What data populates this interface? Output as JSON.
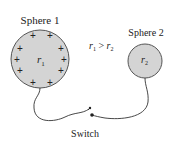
{
  "diagram": {
    "sphere1": {
      "label": "Sphere 1",
      "radius_label": "r",
      "radius_sub": "1",
      "charge_symbol": "+",
      "fill": "#d4d4d4",
      "stroke": "#555555"
    },
    "sphere2": {
      "label": "Sphere 2",
      "radius_label": "r",
      "radius_sub": "2",
      "fill": "#d4d4d4",
      "stroke": "#555555"
    },
    "relation": {
      "a": "r",
      "a_sub": "1",
      "op": " > ",
      "b": "r",
      "b_sub": "2"
    },
    "switch": {
      "label": "Switch"
    }
  }
}
